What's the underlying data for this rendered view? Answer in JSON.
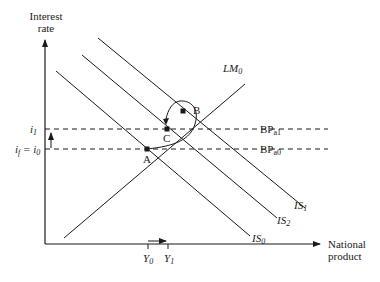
{
  "axes": {
    "y_label_line1": "Interest",
    "y_label_line2": "rate",
    "x_label_line1": "National",
    "x_label_line2": "product"
  },
  "y_ticks": {
    "i1_base": "i",
    "i1_sub": "1",
    "if_base": "i",
    "if_sub": "f",
    "if_eq": " = i",
    "i0_sub": "0"
  },
  "x_ticks": {
    "y0_base": "Y",
    "y0_sub": "0",
    "y1_base": "Y",
    "y1_sub": "1"
  },
  "curves": {
    "lm0_base": "LM",
    "lm0_sub": "0",
    "is0_base": "IS",
    "is0_sub": "0",
    "is1_base": "IS",
    "is1_sub": "1",
    "is2_base": "IS",
    "is2_sub": "2",
    "bpa1_base": "BP",
    "bpa1_sub": "a1",
    "bpa0_base": "BP",
    "bpa0_sub": "a0"
  },
  "points": {
    "a": "A",
    "b": "B",
    "c": "C"
  }
}
